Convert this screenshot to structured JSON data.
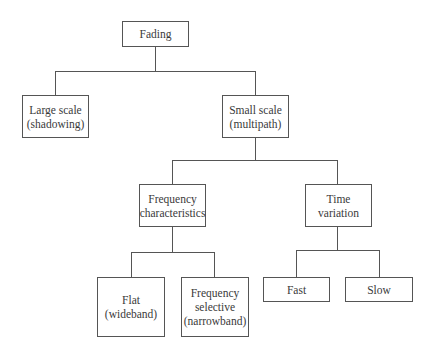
{
  "diagram": {
    "nodes": {
      "root": {
        "line1": "Fading"
      },
      "large": {
        "line1": "Large scale",
        "line2": "(shadowing)"
      },
      "small": {
        "line1": "Small scale",
        "line2": "(multipath)"
      },
      "freq": {
        "line1": "Frequency",
        "line2": "characteristics"
      },
      "time": {
        "line1": "Time",
        "line2": "variation"
      },
      "flat": {
        "line1": "Flat",
        "line2": "(wideband)"
      },
      "fsel": {
        "line1": "Frequency",
        "line2": "selective",
        "line3": "(narrowband)"
      },
      "fast": {
        "line1": "Fast"
      },
      "slow": {
        "line1": "Slow"
      }
    },
    "edges": [
      [
        "Fading",
        "Large scale (shadowing)"
      ],
      [
        "Fading",
        "Small scale (multipath)"
      ],
      [
        "Small scale (multipath)",
        "Frequency characteristics"
      ],
      [
        "Small scale (multipath)",
        "Time variation"
      ],
      [
        "Frequency characteristics",
        "Flat (wideband)"
      ],
      [
        "Frequency characteristics",
        "Frequency selective (narrowband)"
      ],
      [
        "Time variation",
        "Fast"
      ],
      [
        "Time variation",
        "Slow"
      ]
    ]
  }
}
